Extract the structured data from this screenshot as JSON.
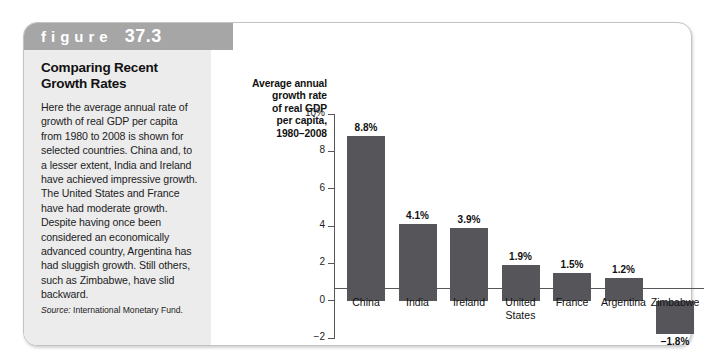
{
  "figure": {
    "label_word": "figure",
    "number": "37.3"
  },
  "caption": {
    "title": "Comparing Recent Growth Rates",
    "body": "Here the average annual rate of growth of real GDP per capita from 1980 to 2008 is shown for selected countries. China and, to a lesser extent, India and Ireland have achieved impressive growth. The United States and France have had moderate growth. Despite having once been considered an economically advanced country, Argentina has had sluggish growth. Still others, such as Zimbabwe, have slid backward.",
    "source_label": "Source:",
    "source_text": "International Monetary Fund."
  },
  "chart_data": {
    "type": "bar",
    "title": "Average annual growth rate of real GDP per capita, 1980–2008",
    "title_lines": [
      "Average annual",
      "growth rate",
      "of real GDP",
      "per capita,",
      "1980–2008"
    ],
    "xlabel": "",
    "ylabel": "Average annual growth rate of real GDP per capita, 1980–2008",
    "categories": [
      "China",
      "India",
      "Ireland",
      "United States",
      "France",
      "Argentina",
      "Zimbabwe"
    ],
    "category_lines": [
      [
        "China"
      ],
      [
        "India"
      ],
      [
        "Ireland"
      ],
      [
        "United",
        "States"
      ],
      [
        "France"
      ],
      [
        "Argentina"
      ],
      [
        "Zimbabwe"
      ]
    ],
    "values": [
      8.8,
      4.1,
      3.9,
      1.9,
      1.5,
      1.2,
      -1.8
    ],
    "value_labels": [
      "8.8%",
      "4.1%",
      "3.9%",
      "1.9%",
      "1.5%",
      "1.2%",
      "−1.8%"
    ],
    "ylim": [
      -2,
      10
    ],
    "yticks": [
      10,
      8,
      6,
      4,
      2,
      0,
      -2
    ],
    "ytick_labels": [
      "10%",
      "8",
      "6",
      "4",
      "2",
      "0",
      "−2"
    ],
    "grid": false,
    "legend": false,
    "bar_color": "#55555a",
    "axis_color": "#55555a"
  },
  "colors": {
    "header_bar": "#a6a6a6",
    "caption_panel": "#ececec",
    "card_border": "#c3c3c3",
    "bar": "#55555a"
  }
}
